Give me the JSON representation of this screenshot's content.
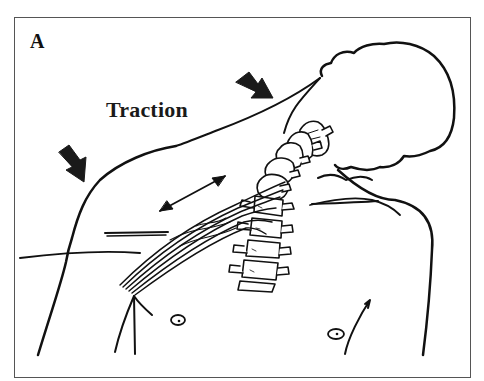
{
  "figure": {
    "panel_label": "A",
    "annotation": "Traction",
    "colors": {
      "ink": "#111111",
      "frame": "#555555",
      "background": "#ffffff"
    },
    "elements": {
      "arrows": [
        {
          "name": "traction-arrow-head",
          "direction": "down-right",
          "position": "upper center, near head"
        },
        {
          "name": "traction-arrow-shoulder",
          "direction": "down-right",
          "position": "left, above shoulder"
        },
        {
          "name": "stretch-double-arrow",
          "direction": "bidirectional diagonal",
          "position": "over nerve bundle"
        }
      ],
      "anatomy": [
        "head outline",
        "neck",
        "left shoulder",
        "right shoulder",
        "cervical spine",
        "brachial plexus nerves",
        "nipples",
        "clavicle lines"
      ]
    }
  }
}
